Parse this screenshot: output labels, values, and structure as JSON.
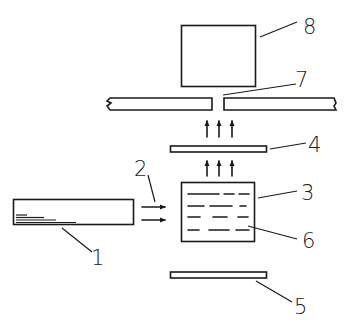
{
  "diagram": {
    "type": "schematic",
    "labels": {
      "l1": "1",
      "l2": "2",
      "l3": "3",
      "l4": "4",
      "l5": "5",
      "l6": "6",
      "l7": "7",
      "l8": "8"
    },
    "components": [
      {
        "id": "1",
        "shape": "rectangle",
        "description": "horizontal bar with stepped inner lines at lower-left"
      },
      {
        "id": "2",
        "shape": "arrows",
        "description": "two horizontal rightward arrows between component 1 and 3"
      },
      {
        "id": "3",
        "shape": "rectangle",
        "description": "square box with dashed horizontal lines"
      },
      {
        "id": "4",
        "shape": "thin-plate",
        "description": "thin horizontal plate above component 3"
      },
      {
        "id": "5",
        "shape": "thin-plate",
        "description": "thin horizontal plate below component 3"
      },
      {
        "id": "6",
        "shape": "dashed-lines",
        "description": "dashed lines inside component 3"
      },
      {
        "id": "7",
        "shape": "slit-plate",
        "description": "long broken plate with a central slit/aperture"
      },
      {
        "id": "8",
        "shape": "rectangle",
        "description": "box above the slit"
      }
    ],
    "flows": [
      {
        "from": "1",
        "to": "3",
        "direction": "right",
        "count": 2
      },
      {
        "from": "3",
        "to": "4",
        "direction": "up",
        "count": 3
      },
      {
        "from": "4",
        "to": "7",
        "direction": "up",
        "count": 3
      }
    ],
    "colors": {
      "stroke": "#1a1a1a",
      "background": "#ffffff"
    }
  }
}
